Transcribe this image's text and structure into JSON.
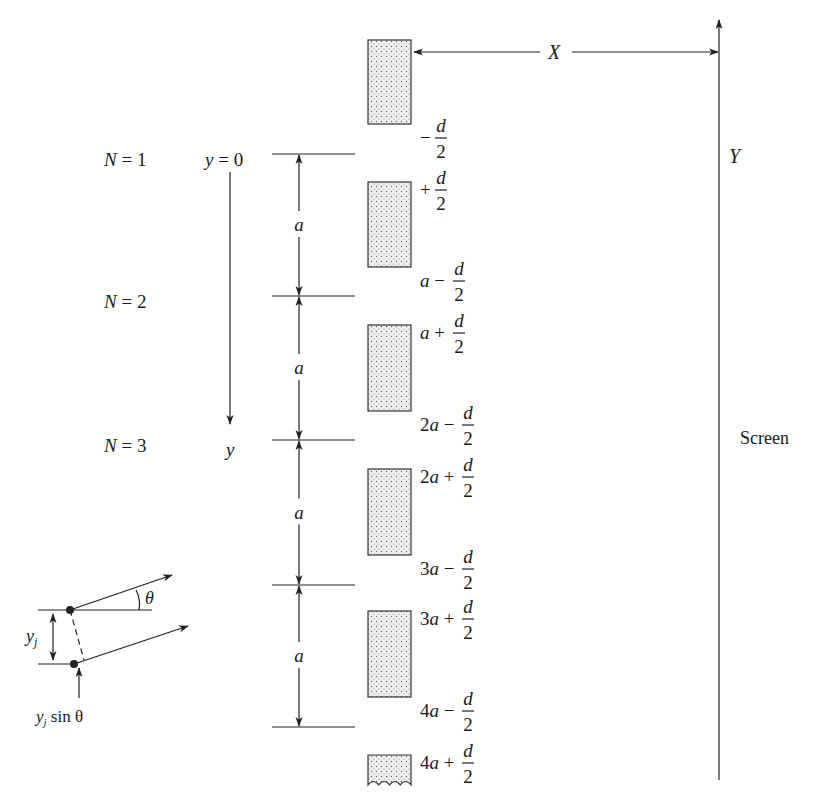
{
  "figure": {
    "screen_label": "Screen",
    "distance_label": "X",
    "screen_axis_label": "Y",
    "y_axis": {
      "origin_label": "y = 0",
      "axis_label": "y"
    },
    "slit_index_labels": [
      {
        "text": "N = 1",
        "y": 160
      },
      {
        "text": "N = 2",
        "y": 302
      },
      {
        "text": "N = 3",
        "y": 446
      }
    ],
    "spacing_label": "a",
    "spacing_lines_y": [
      154,
      296,
      440,
      585,
      727
    ],
    "slits": [
      {
        "top": 40,
        "bottom": 124,
        "upper_label": null,
        "lower_label": {
          "pre": "−",
          "frac": [
            "d",
            "2"
          ]
        }
      },
      {
        "top": 182,
        "bottom": 267,
        "upper_label": {
          "pre": "+",
          "frac": [
            "d",
            "2"
          ]
        },
        "lower_label": {
          "pre": "a −",
          "frac": [
            "d",
            "2"
          ]
        }
      },
      {
        "top": 325,
        "bottom": 411,
        "upper_label": {
          "pre": "a +",
          "frac": [
            "d",
            "2"
          ]
        },
        "lower_label": {
          "pre": "2a −",
          "frac": [
            "d",
            "2"
          ]
        }
      },
      {
        "top": 469,
        "bottom": 555,
        "upper_label": {
          "pre": "2a +",
          "frac": [
            "d",
            "2"
          ]
        },
        "lower_label": {
          "pre": "3a −",
          "frac": [
            "d",
            "2"
          ]
        }
      },
      {
        "top": 611,
        "bottom": 697,
        "upper_label": {
          "pre": "3a +",
          "frac": [
            "d",
            "2"
          ]
        },
        "lower_label": {
          "pre": "4a −",
          "frac": [
            "d",
            "2"
          ]
        }
      },
      {
        "top": 755,
        "bottom": 785,
        "upper_label": {
          "pre": "4a +",
          "frac": [
            "d",
            "2"
          ]
        },
        "lower_label": null,
        "truncated": true
      }
    ],
    "inset": {
      "angle_label": "θ",
      "separation_label": "y",
      "separation_subscript": "j",
      "path_diff_label": "y",
      "path_diff_subscript": "j",
      "path_diff_suffix": " sin θ"
    },
    "colors": {
      "ink": "#222222",
      "slit_fill": "#e6e6e6",
      "dot": "#555555"
    }
  }
}
